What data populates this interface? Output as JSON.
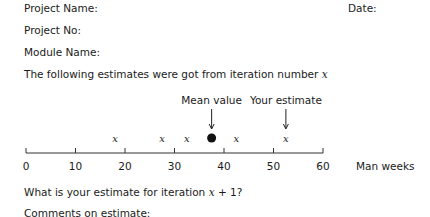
{
  "form": {
    "project_name_label": "Project Name:",
    "date_label": "Date:",
    "project_no_label": "Project No:",
    "module_name_label": "Module Name:",
    "intro_text": "The following estimates were got from iteration number ",
    "intro_var": "x",
    "question_prefix": "What is your estimate for iteration ",
    "question_var": "x",
    "question_suffix": " + 1?",
    "comments_label": "Comments on estimate:"
  },
  "chart_data": {
    "type": "scatter",
    "title": "",
    "xlabel": "Man weeks",
    "ylabel": "",
    "xlim": [
      0,
      60
    ],
    "x_ticks": [
      0,
      10,
      20,
      30,
      40,
      50,
      60
    ],
    "tick_labels": [
      "0",
      "10",
      "20",
      "30",
      "40",
      "50",
      "60"
    ],
    "grid": false,
    "series": [
      {
        "name": "Estimates",
        "marker": "x",
        "values": [
          18,
          27.5,
          32.5,
          42.5,
          52.5
        ]
      },
      {
        "name": "Mean value",
        "marker": "filled-circle",
        "values": [
          37.5
        ]
      }
    ],
    "annotations": [
      {
        "text": "Mean value",
        "x": 37.5,
        "arrow": true
      },
      {
        "text": "Your estimate",
        "x": 52.5,
        "arrow": true
      }
    ]
  }
}
